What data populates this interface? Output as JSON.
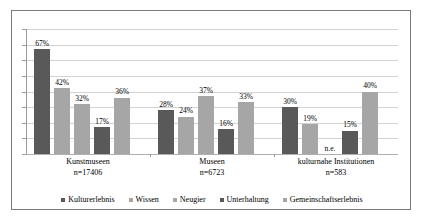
{
  "chart_data": {
    "type": "bar",
    "title": "",
    "subtitle": "",
    "xlabel": "",
    "ylabel": "",
    "ylim": [
      0,
      80
    ],
    "y_tick_step": 10,
    "y_tick_labels_shown": false,
    "grid": true,
    "legend_position": "bottom",
    "value_suffix": "%",
    "missing_label": "n.e.",
    "categories": [
      {
        "name": "Kunstmuseen",
        "n_label": "n=17406"
      },
      {
        "name": "Museen",
        "n_label": "n=6723"
      },
      {
        "name": "kulturnahe Institutionen",
        "n_label": "n=583"
      }
    ],
    "series": [
      {
        "name": "Kulturerlebnis",
        "color": "#595959",
        "values": [
          67,
          28,
          30
        ],
        "labels": [
          "67%",
          "28%",
          "30%"
        ]
      },
      {
        "name": "Wissen",
        "color": "#a6a6a6",
        "values": [
          42,
          24,
          19
        ],
        "labels": [
          "42%",
          "24%",
          "19%"
        ]
      },
      {
        "name": "Neugier",
        "color": "#a6a6a6",
        "values": [
          32,
          37,
          null
        ],
        "labels": [
          "32%",
          "37%",
          "n.e."
        ]
      },
      {
        "name": "Unterhaltung",
        "color": "#595959",
        "values": [
          17,
          16,
          15
        ],
        "labels": [
          "17%",
          "16%",
          "15%"
        ]
      },
      {
        "name": "Gemeinschaftserlebnis",
        "color": "#a6a6a6",
        "values": [
          36,
          33,
          40
        ],
        "labels": [
          "36%",
          "33%",
          "40%"
        ]
      }
    ]
  },
  "legend": {
    "items": [
      {
        "label": "Kulturerlebnis",
        "color": "#595959"
      },
      {
        "label": "Wissen",
        "color": "#a6a6a6"
      },
      {
        "label": "Neugier",
        "color": "#a6a6a6"
      },
      {
        "label": "Unterhaltung",
        "color": "#595959"
      },
      {
        "label": "Gemeinschaftserlebnis",
        "color": "#a6a6a6"
      }
    ]
  },
  "style": {
    "frame_border_color": "#7a7a7a",
    "gridline_color": "#d2d2d2",
    "axis_color": "#9a9a9a",
    "background": "#ffffff",
    "dark_bar": "#595959",
    "light_bar": "#a6a6a6"
  }
}
